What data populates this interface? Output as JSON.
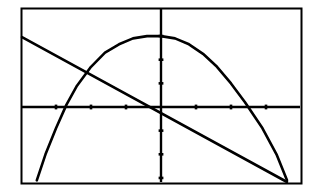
{
  "chart_data": {
    "type": "line",
    "title": "",
    "subtitle": "",
    "xlabel": "",
    "ylabel": "",
    "grid": false,
    "legend": false,
    "legend_position": "none",
    "background_color": "#ffffff",
    "line_color": "#000000",
    "axis_color": "#000000",
    "frame_color": "#000000",
    "viewport": {
      "frame_left_px": 21,
      "frame_top_px": 8,
      "frame_right_px": 301,
      "frame_bottom_px": 183,
      "origin_x_px": 161,
      "origin_y_px": 107,
      "x_tick_spacing_px": 35,
      "y_tick_spacing_px": 23.5
    },
    "xlim": [
      -4,
      4
    ],
    "ylim": [
      -3.2,
      4.2
    ],
    "xticks": [
      -3,
      -2,
      -1,
      1,
      2,
      3
    ],
    "yticks": [
      -3,
      -2,
      -1,
      1,
      2,
      3
    ],
    "xtick_labels": [],
    "ytick_labels": [],
    "series": [
      {
        "name": "parabola",
        "type": "quadratic",
        "color": "#000000",
        "vertex": [
          -0.2,
          3.0
        ],
        "x_intercepts": [
          -3.5,
          2.9
        ],
        "points": [
          [
            -3.55,
            -3.1
          ],
          [
            -3.3,
            -2.0
          ],
          [
            -3.0,
            -0.9
          ],
          [
            -2.7,
            0.1
          ],
          [
            -2.4,
            0.9
          ],
          [
            -2.0,
            1.7
          ],
          [
            -1.6,
            2.3
          ],
          [
            -1.2,
            2.65
          ],
          [
            -0.8,
            2.9
          ],
          [
            -0.4,
            3.0
          ],
          [
            0.0,
            3.0
          ],
          [
            0.4,
            2.9
          ],
          [
            0.8,
            2.65
          ],
          [
            1.2,
            2.25
          ],
          [
            1.6,
            1.7
          ],
          [
            2.0,
            1.0
          ],
          [
            2.4,
            0.2
          ],
          [
            2.9,
            -0.9
          ],
          [
            3.3,
            -2.0
          ],
          [
            3.6,
            -3.1
          ]
        ]
      },
      {
        "name": "line",
        "type": "linear",
        "color": "#000000",
        "slope": -0.83,
        "y_intercept": -0.45,
        "x_intercept": -0.52,
        "points": [
          [
            -4.0,
            2.95
          ],
          [
            -0.52,
            0.0
          ],
          [
            3.6,
            -3.2
          ]
        ]
      }
    ],
    "intersections": [
      [
        -2.25,
        1.45
      ]
    ],
    "annotations": []
  },
  "screen": {
    "name": "graphing-calculator-plot",
    "description": "Graph of a downward parabola and a decreasing line on a bordered coordinate grid"
  }
}
